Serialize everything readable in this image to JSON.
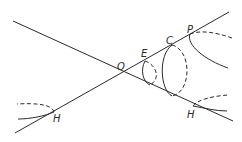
{
  "diagram": {
    "type": "cone-hyperbola-figure",
    "labels": {
      "O": "O",
      "E": "E",
      "C": "C",
      "P": "P",
      "H_right": "H",
      "H_left": "H"
    },
    "colors": {
      "stroke": "#2a2a2a",
      "background": "#ffffff"
    }
  }
}
